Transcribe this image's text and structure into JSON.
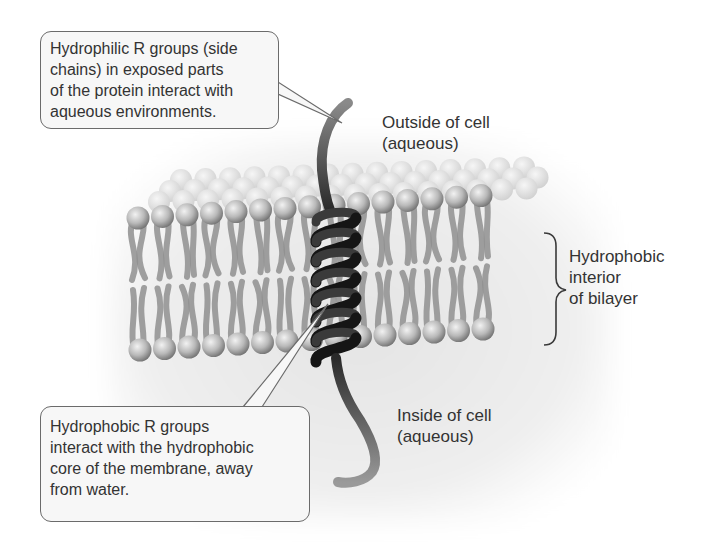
{
  "figure": {
    "callouts": {
      "hydrophilic": {
        "lines": [
          "Hydrophilic R groups (side",
          "chains) in exposed parts",
          "of the protein interact with",
          "aqueous environments."
        ]
      },
      "hydrophobic": {
        "lines": [
          "Hydrophobic R groups",
          "interact with the hydrophobic",
          "core of the membrane, away",
          "from water."
        ]
      }
    },
    "labels": {
      "outside": [
        "Outside of cell",
        "(aqueous)"
      ],
      "inside": [
        "Inside of cell",
        "(aqueous)"
      ],
      "interior": [
        "Hydrophobic",
        "interior",
        "of bilayer"
      ]
    },
    "colors": {
      "background_haze": "#e9e9e9",
      "phospholipid_head": "#b5b5b5",
      "phospholipid_tail": "#8d8d8d",
      "protein_helix": "#1e1e1e",
      "callout_border": "#6b6b6b",
      "text": "#333333"
    }
  }
}
